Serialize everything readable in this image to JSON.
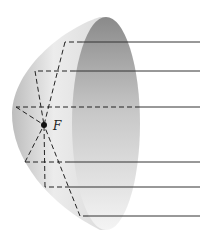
{
  "diagram": {
    "focus_label": "F",
    "colors": {
      "background": "#ffffff",
      "dish_outer_light": "#f2f2f2",
      "dish_outer_shade": "#b8b8b8",
      "dish_inner_dark": "#8c8c8c",
      "dish_inner_light": "#e6e6e6",
      "ray": "#333333"
    },
    "rays": [
      {
        "y": 42,
        "hit_x": 65
      },
      {
        "y": 71,
        "hit_x": 35
      },
      {
        "y": 107,
        "hit_x": 16
      },
      {
        "y": 162,
        "hit_x": 25
      },
      {
        "y": 187,
        "hit_x": 45
      },
      {
        "y": 216,
        "hit_x": 80
      }
    ],
    "focus": {
      "x": 44,
      "y": 125
    }
  }
}
